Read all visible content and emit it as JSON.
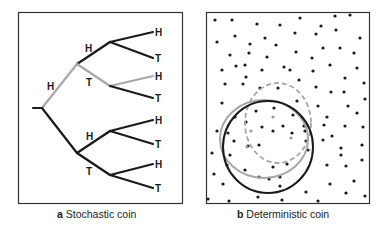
{
  "panels": [
    {
      "id": "a",
      "letter": "a",
      "caption": "Stochastic coin",
      "type": "binary-probability-tree",
      "levels": [
        {
          "edges": [
            {
              "label": "H",
              "highlighted": true
            },
            {
              "label": "T",
              "highlighted": false
            }
          ]
        },
        {
          "edges": [
            {
              "label": "H",
              "highlighted": false
            },
            {
              "label": "T",
              "highlighted": true
            },
            {
              "label": "H",
              "highlighted": false
            },
            {
              "label": "T",
              "highlighted": false
            }
          ]
        },
        {
          "edges": [
            {
              "label": "H",
              "highlighted": false
            },
            {
              "label": "T",
              "highlighted": false
            },
            {
              "label": "H",
              "highlighted": true
            },
            {
              "label": "T",
              "highlighted": false
            },
            {
              "label": "H",
              "highlighted": false
            },
            {
              "label": "T",
              "highlighted": false
            },
            {
              "label": "H",
              "highlighted": false
            },
            {
              "label": "T",
              "highlighted": false
            }
          ]
        }
      ],
      "labels": {
        "l1_upper": "H",
        "l2_upper_h": "H",
        "l2_upper_t": "T",
        "l2_lower_h": "H",
        "l2_lower_t": "T",
        "leaves": [
          "H",
          "T",
          "H",
          "T",
          "H",
          "T",
          "H",
          "T"
        ]
      }
    },
    {
      "id": "b",
      "letter": "b",
      "caption": "Deterministic coin",
      "type": "scatter-with-regions",
      "regions": [
        {
          "name": "black-solid-region",
          "style": "solid",
          "color": "#1a1a1a"
        },
        {
          "name": "gray-solid-region",
          "style": "solid",
          "color": "#a6a6a6"
        },
        {
          "name": "gray-dashed-region",
          "style": "dashed",
          "color": "#a6a6a6"
        }
      ]
    }
  ],
  "colors": {
    "line_dark": "#1a1a1a",
    "line_highlight": "#a8a8a8",
    "frame": "#333333",
    "dot": "#1a1a1a",
    "dot_highlight": "#9a9a9a"
  }
}
